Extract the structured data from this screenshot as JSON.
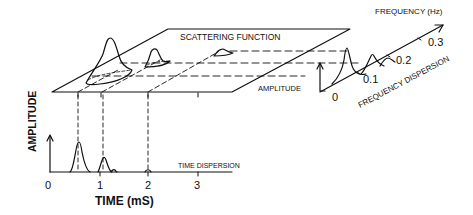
{
  "labels": {
    "scattering_function": "SCATTERING FUNCTION",
    "frequency_axis_title": "FREQUENCY (Hz)",
    "frequency_dispersion": "FREQUENCY DISPERSION",
    "amplitude_freq": "AMPLITUDE",
    "amplitude_time": "AMPLITUDE",
    "time_dispersion": "TIME DISPERSION",
    "time_axis_title": "TIME (mS)"
  },
  "time_axis": {
    "ticks": [
      "0",
      "1",
      "2",
      "3"
    ],
    "unit": "mS"
  },
  "frequency_axis": {
    "ticks": [
      "0",
      "0.1",
      "0.2",
      "0.3"
    ],
    "unit": "Hz"
  },
  "time_dispersion_peaks": [
    {
      "time_ms": 0.55,
      "relative_amplitude": 1.0
    },
    {
      "time_ms": 1.05,
      "relative_amplitude": 0.45
    },
    {
      "time_ms": 1.3,
      "relative_amplitude": 0.05
    },
    {
      "time_ms": 2.0,
      "relative_amplitude": 0.05
    }
  ],
  "frequency_dispersion_peaks": [
    {
      "freq_hz": 0.05,
      "relative_amplitude": 1.0
    },
    {
      "freq_hz": 0.15,
      "relative_amplitude": 0.5
    },
    {
      "freq_hz": 0.22,
      "relative_amplitude": 0.25
    }
  ],
  "colors": {
    "ink": "#111111",
    "background": "#ffffff"
  }
}
